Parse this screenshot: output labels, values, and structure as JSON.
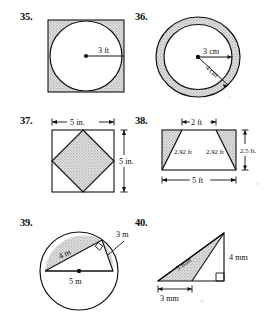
{
  "page": {
    "kind": "geometry-worksheet-figures",
    "width": 268,
    "height": 314,
    "background_color": "#ffffff",
    "ink_color": "#111111",
    "shade_color": "#c9c9c9"
  },
  "problems": [
    {
      "number": "35.",
      "figure": "square-with-inscribed-circle",
      "shaded_region": "square-minus-circle",
      "labels": [
        {
          "id": "radius",
          "text": "3 ft"
        }
      ]
    },
    {
      "number": "36.",
      "figure": "annulus-two-concentric-circles",
      "shaded_region": "ring-between-circles",
      "labels": [
        {
          "id": "inner-radius",
          "text": "3 cm"
        },
        {
          "id": "outer-radius",
          "text": "4 cm"
        }
      ]
    },
    {
      "number": "37.",
      "figure": "square-with-inscribed-rotated-square",
      "shaded_region": "inner-rotated-square",
      "labels": [
        {
          "id": "width",
          "text": "5 in."
        },
        {
          "id": "height",
          "text": "5 in."
        }
      ]
    },
    {
      "number": "38.",
      "figure": "rectangle-with-inscribed-trapezoid",
      "shaded_region": "two-corner-triangles",
      "labels": [
        {
          "id": "top",
          "text": "2 ft"
        },
        {
          "id": "left-leg",
          "text": "2.92 ft"
        },
        {
          "id": "right-leg",
          "text": "2.92 ft"
        },
        {
          "id": "height",
          "text": "2.5 ft."
        },
        {
          "id": "bottom",
          "text": "5 ft"
        }
      ]
    },
    {
      "number": "39.",
      "figure": "circle-with-inscribed-right-triangle",
      "shaded_region": "circular-segment-above-leg",
      "labels": [
        {
          "id": "long-leg",
          "text": "4 m"
        },
        {
          "id": "short-leg",
          "text": "3 m"
        },
        {
          "id": "diameter",
          "text": "5 m"
        }
      ]
    },
    {
      "number": "40.",
      "figure": "right-triangle-with-inner-triangle",
      "shaded_region": "inner-left-triangle",
      "labels": [
        {
          "id": "hypotenuse",
          "text": "5 mm"
        },
        {
          "id": "vertical-leg",
          "text": "4 mm"
        },
        {
          "id": "base-segment",
          "text": "3 mm"
        }
      ]
    }
  ]
}
